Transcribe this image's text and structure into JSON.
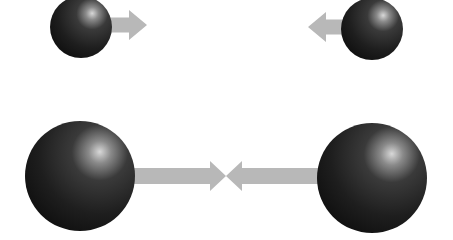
{
  "diagram": {
    "colors": {
      "background": "#ffffff",
      "arrow": "#b8b8b8",
      "sphere_dark": "#141414",
      "sphere_mid": "#2e2e2e",
      "sphere_highlight": "#d8d8d8"
    },
    "pairs": [
      {
        "name": "small-mass-pair",
        "spheres": [
          {
            "side": "left",
            "cx": 81,
            "cy": 27,
            "r": 31
          },
          {
            "side": "right",
            "cx": 372,
            "cy": 29,
            "r": 31
          }
        ],
        "arrows": [
          {
            "direction": "right",
            "x_start": 110,
            "x_end": 147,
            "cy": 25,
            "shaft_h": 15,
            "head_h": 30,
            "head_len": 18
          },
          {
            "direction": "left",
            "x_start": 345,
            "x_end": 308,
            "cy": 27,
            "shaft_h": 15,
            "head_h": 30,
            "head_len": 18
          }
        ]
      },
      {
        "name": "large-mass-pair",
        "spheres": [
          {
            "side": "left",
            "cx": 80,
            "cy": 176,
            "r": 55
          },
          {
            "side": "right",
            "cx": 372,
            "cy": 178,
            "r": 55
          }
        ],
        "arrows": [
          {
            "direction": "right",
            "x_start": 134,
            "x_end": 226,
            "cy": 176,
            "shaft_h": 16,
            "head_h": 30,
            "head_len": 16
          },
          {
            "direction": "left",
            "x_start": 318,
            "x_end": 226,
            "cy": 176,
            "shaft_h": 16,
            "head_h": 30,
            "head_len": 16
          }
        ]
      }
    ]
  }
}
